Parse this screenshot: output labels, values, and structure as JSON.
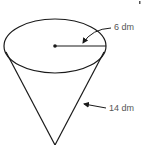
{
  "diagram": {
    "shape": "cone",
    "labels": {
      "radius": "6 dm",
      "slant_height": "14 dm"
    },
    "stroke_color": "#1a1a1a"
  }
}
